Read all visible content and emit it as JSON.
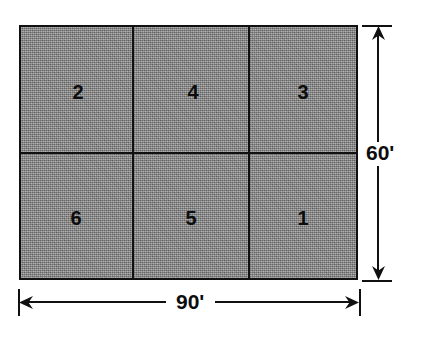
{
  "figure": {
    "fill_color": "#8c8c8c",
    "line_color": "#101010",
    "background_color": "#ffffff"
  },
  "lot": {
    "parcels": [
      {
        "label": "2",
        "row": "top",
        "column": "left"
      },
      {
        "label": "4",
        "row": "top",
        "column": "center"
      },
      {
        "label": "3",
        "row": "top",
        "column": "right"
      },
      {
        "label": "6",
        "row": "bottom",
        "column": "left"
      },
      {
        "label": "5",
        "row": "bottom",
        "column": "center"
      },
      {
        "label": "1",
        "row": "bottom",
        "column": "right"
      }
    ],
    "rows": 2,
    "columns": 3
  },
  "dimensions": {
    "width": {
      "value": "90'",
      "units": "feet",
      "orientation": "horizontal",
      "position": "bottom"
    },
    "height": {
      "value": "60'",
      "units": "feet",
      "orientation": "vertical",
      "position": "right"
    }
  },
  "icons": {
    "arrow_left": "arrow-left-icon",
    "arrow_right": "arrow-right-icon",
    "arrow_up": "arrow-up-icon",
    "arrow_down": "arrow-down-icon"
  }
}
